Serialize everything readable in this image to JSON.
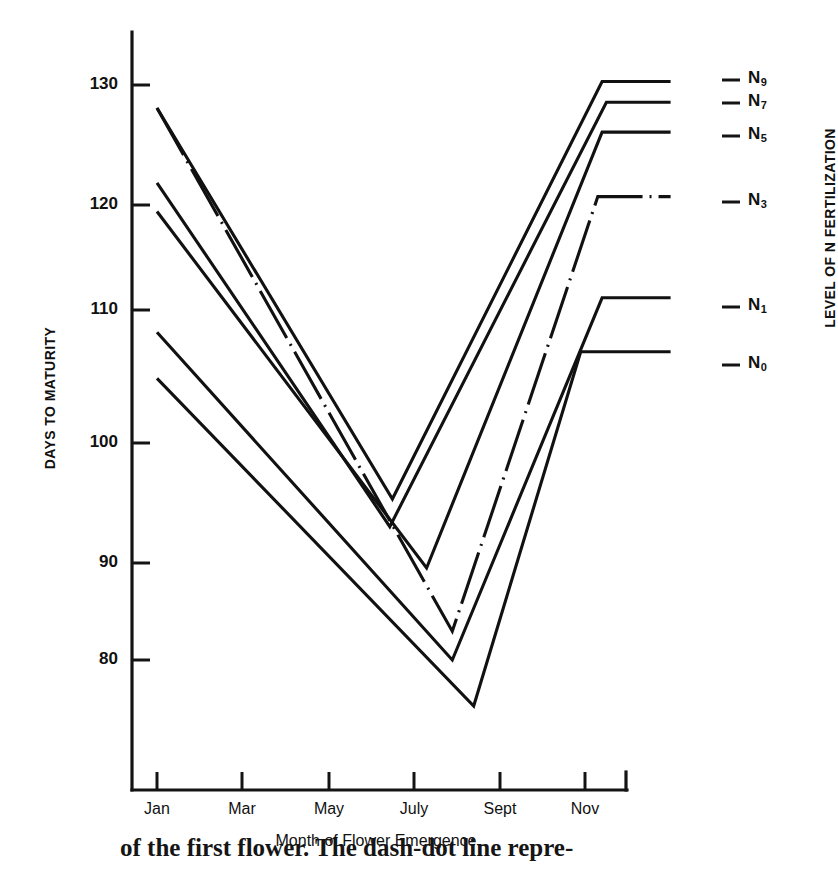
{
  "chart_data": {
    "type": "line",
    "title": "",
    "xlabel": "Month of Flower Emergence",
    "ylabel": "DAYS TO MATURITY",
    "right_axis_label": "LEVEL OF N FERTILIZATION",
    "categories": [
      "Jan",
      "Mar",
      "May",
      "July",
      "Sept",
      "Nov"
    ],
    "x_tick_labels": [
      "Jan",
      "Mar",
      "May",
      "July",
      "Sept",
      "Nov"
    ],
    "y_tick_labels": [
      "130",
      "120",
      "110",
      "100",
      "90",
      "80"
    ],
    "y_tick_values": [
      130,
      120,
      110,
      100,
      90,
      80
    ],
    "ylim": [
      72,
      132
    ],
    "xlim": [
      0,
      7
    ],
    "grid": false,
    "legend_position": "right-of-plot-line-ends",
    "series": [
      {
        "name": "N9",
        "label": "N9",
        "style": "solid",
        "x": [
          1,
          3.75,
          6.2,
          7.0
        ],
        "y": [
          128.0,
          94.0,
          130.3,
          130.3
        ],
        "min_value": 94.0,
        "max_value": 130.3,
        "start_value": 128.0
      },
      {
        "name": "N7",
        "label": "N7",
        "style": "solid",
        "x": [
          1,
          3.72,
          6.25,
          7.0
        ],
        "y": [
          121.5,
          91.6,
          128.5,
          128.5
        ],
        "min_value": 91.6,
        "max_value": 128.5,
        "start_value": 121.5
      },
      {
        "name": "N5",
        "label": "N5",
        "style": "solid",
        "x": [
          1,
          4.15,
          6.2,
          7.0
        ],
        "y": [
          119.0,
          88.0,
          125.9,
          125.9
        ],
        "min_value": 88.0,
        "max_value": 125.9,
        "start_value": 119.0
      },
      {
        "name": "N3",
        "label": "N3",
        "style": "dash-dot",
        "x": [
          1,
          4.45,
          6.15,
          7.0
        ],
        "y": [
          128.0,
          82.5,
          120.3,
          120.3
        ],
        "min_value": 82.5,
        "max_value": 128.0,
        "start_value": 128.0
      },
      {
        "name": "N1",
        "label": "N1",
        "style": "solid",
        "x": [
          1,
          4.45,
          6.2,
          7.0
        ],
        "y": [
          108.5,
          80.0,
          111.5,
          111.5
        ],
        "min_value": 80.0,
        "max_value": 111.5,
        "start_value": 108.5
      },
      {
        "name": "N0",
        "label": "N0",
        "style": "solid",
        "x": [
          1,
          4.7,
          5.95,
          7.0
        ],
        "y": [
          104.5,
          76.0,
          106.8,
          106.8
        ],
        "min_value": 76.0,
        "max_value": 106.8,
        "start_value": 104.5
      }
    ],
    "series_end_labels": [
      "N9",
      "N7",
      "N5",
      "N3",
      "N1",
      "N0"
    ],
    "units": "days"
  },
  "axes": {
    "y_title": "DAYS TO MATURITY",
    "x_title": "Month of Flower Emergence",
    "right_title": "LEVEL OF N FERTILIZATION",
    "y_ticks": [
      {
        "label": "130",
        "value": 130
      },
      {
        "label": "120",
        "value": 120
      },
      {
        "label": "110",
        "value": 110
      },
      {
        "label": "100",
        "value": 100
      },
      {
        "label": "90",
        "value": 90
      },
      {
        "label": "80",
        "value": 80
      }
    ],
    "x_ticks": [
      {
        "label": "Jan"
      },
      {
        "label": "Mar"
      },
      {
        "label": "May"
      },
      {
        "label": "July"
      },
      {
        "label": "Sept"
      },
      {
        "label": "Nov"
      }
    ]
  },
  "series_labels": [
    {
      "base": "N",
      "sub": "9"
    },
    {
      "base": "N",
      "sub": "7"
    },
    {
      "base": "N",
      "sub": "5"
    },
    {
      "base": "N",
      "sub": "3"
    },
    {
      "base": "N",
      "sub": "1"
    },
    {
      "base": "N",
      "sub": "0"
    }
  ],
  "caption": {
    "text": "of the first flower. The dash-dot line repre-"
  },
  "colors": {
    "line": "#111111",
    "axis": "#141414",
    "background": "#ffffff"
  }
}
